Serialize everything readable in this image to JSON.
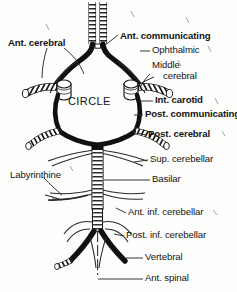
{
  "figure": {
    "title_text": "CIRCLE",
    "background_color": "#fdfdfc",
    "ink_color": "#141414"
  },
  "center_label": {
    "text": "CIRCLE"
  },
  "labels": [
    {
      "id": "ant-cerebral",
      "text": "Ant. cerebral",
      "weight": "bold",
      "x": 8,
      "y": 38,
      "size": 9.6,
      "align": "left"
    },
    {
      "id": "ant-communicating",
      "text": "Ant. communicating",
      "weight": "bold",
      "x": 120,
      "y": 31,
      "size": 9.6,
      "align": "left"
    },
    {
      "id": "ophthalmic",
      "text": "Ophthalmic",
      "weight": "regular",
      "x": 152,
      "y": 50,
      "size": 9.6,
      "align": "left"
    },
    {
      "id": "middle-cerebral-l1",
      "text": "Middle",
      "weight": "regular",
      "x": 152,
      "y": 64,
      "size": 9.6,
      "align": "left"
    },
    {
      "id": "middle-cerebral-l2",
      "text": "cerebral",
      "weight": "regular",
      "x": 163,
      "y": 75,
      "size": 9.6,
      "align": "left"
    },
    {
      "id": "int-carotid",
      "text": "Int. carotid",
      "weight": "bold",
      "x": 155,
      "y": 99,
      "size": 9.6,
      "align": "left"
    },
    {
      "id": "post-communicating",
      "text": "Post. communicating",
      "weight": "bold",
      "x": 145,
      "y": 113,
      "size": 9.6,
      "align": "left"
    },
    {
      "id": "post-cerebral",
      "text": "Post. cerebral",
      "weight": "bold",
      "x": 148,
      "y": 133,
      "size": 9.6,
      "align": "left"
    },
    {
      "id": "sup-cerebellar",
      "text": "Sup. cerebellar",
      "weight": "regular",
      "x": 150,
      "y": 157,
      "size": 9.6,
      "align": "left"
    },
    {
      "id": "labyrinthine",
      "text": "Labyrinthine",
      "weight": "regular",
      "x": 10,
      "y": 175,
      "size": 9.6,
      "align": "left"
    },
    {
      "id": "basilar",
      "text": "Basilar",
      "weight": "regular",
      "x": 152,
      "y": 178,
      "size": 9.6,
      "align": "left"
    },
    {
      "id": "ant-inf-cerebellar",
      "text": "Ant. inf. cerebellar",
      "weight": "regular",
      "x": 128,
      "y": 211,
      "size": 9.6,
      "align": "left"
    },
    {
      "id": "post-inf-cerebellar",
      "text": "Post. inf. cerebellar",
      "weight": "regular",
      "x": 126,
      "y": 234,
      "size": 9.6,
      "align": "left"
    },
    {
      "id": "vertebral",
      "text": "Vertebral",
      "weight": "regular",
      "x": 145,
      "y": 256,
      "size": 9.6,
      "align": "left"
    },
    {
      "id": "ant-spinal",
      "text": "Ant. spinal",
      "weight": "regular",
      "x": 145,
      "y": 277,
      "size": 9.6,
      "align": "left"
    }
  ]
}
